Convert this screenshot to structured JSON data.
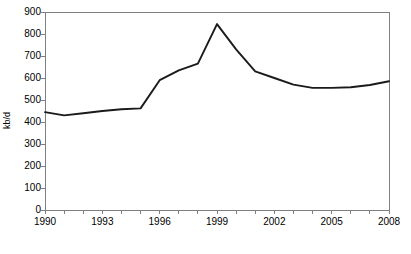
{
  "chart_data": {
    "type": "line",
    "title": "",
    "xlabel": "",
    "ylabel": "kb/d",
    "xlim": [
      1990,
      2008
    ],
    "ylim": [
      0,
      900
    ],
    "grid": false,
    "legend": null,
    "x_tick_labels": [
      "1990",
      "1993",
      "1996",
      "1999",
      "2002",
      "2005",
      "2008"
    ],
    "x_tick_values": [
      1990,
      1993,
      1996,
      1999,
      2002,
      2005,
      2008
    ],
    "x_minor_ticks": [
      1990,
      1991,
      1992,
      1993,
      1994,
      1995,
      1996,
      1997,
      1998,
      1999,
      2000,
      2001,
      2002,
      2003,
      2004,
      2005,
      2006,
      2007,
      2008
    ],
    "y_tick_labels": [
      "0",
      "100",
      "200",
      "300",
      "400",
      "500",
      "600",
      "700",
      "800",
      "900"
    ],
    "y_tick_values": [
      0,
      100,
      200,
      300,
      400,
      500,
      600,
      700,
      800,
      900
    ],
    "x": [
      1990,
      1991,
      1992,
      1993,
      1994,
      1995,
      1996,
      1997,
      1998,
      1999,
      2000,
      2001,
      2002,
      2003,
      2004,
      2005,
      2006,
      2007,
      2008
    ],
    "values": [
      445,
      430,
      440,
      450,
      458,
      462,
      590,
      635,
      665,
      845,
      730,
      630,
      600,
      570,
      555,
      555,
      558,
      568,
      585
    ],
    "series_color": "#1a1a1a",
    "axis_color": "#808080"
  },
  "y_axis_label_text": "kb/d"
}
